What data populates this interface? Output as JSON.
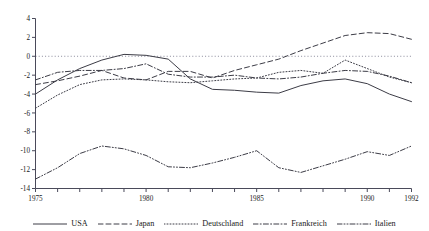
{
  "chart_data": {
    "type": "line",
    "title": "",
    "subtitle": "",
    "xlabel": "",
    "ylabel": "",
    "xlim": [
      1975,
      1992
    ],
    "ylim": [
      -14,
      4
    ],
    "ytick_step": 2,
    "yticks": [
      4,
      2,
      0,
      -2,
      -4,
      -6,
      -8,
      -10,
      -12,
      -14
    ],
    "ytick_labels": [
      "4",
      "2",
      "0",
      "-2",
      "-4",
      "-6",
      "-8",
      "-10",
      "-12",
      "-14"
    ],
    "xticks": [
      1975,
      1976,
      1977,
      1978,
      1979,
      1980,
      1981,
      1982,
      1983,
      1984,
      1985,
      1986,
      1987,
      1988,
      1989,
      1990,
      1991,
      1992
    ],
    "xtick_labels_shown": [
      "1975",
      "1980",
      "1985",
      "1990",
      "1992"
    ],
    "xtick_label_years": [
      1975,
      1980,
      1985,
      1990,
      1992
    ],
    "grid": false,
    "zero_reference_line": true,
    "legend_position": "bottom",
    "x": [
      1975,
      1976,
      1977,
      1978,
      1979,
      1980,
      1981,
      1982,
      1983,
      1984,
      1985,
      1986,
      1987,
      1988,
      1989,
      1990,
      1991,
      1992
    ],
    "series": [
      {
        "name": "USA",
        "style": "solid",
        "values": [
          -4.0,
          -2.5,
          -1.3,
          -0.4,
          0.2,
          0.1,
          -0.3,
          -2.4,
          -3.5,
          -3.6,
          -3.8,
          -3.9,
          -3.1,
          -2.6,
          -2.4,
          -2.9,
          -4.0,
          -4.8
        ]
      },
      {
        "name": "Japan",
        "style": "dashed",
        "values": [
          -3.0,
          -2.6,
          -2.1,
          -1.5,
          -2.3,
          -2.5,
          -1.6,
          -1.6,
          -2.3,
          -1.5,
          -0.9,
          -0.3,
          0.6,
          1.4,
          2.2,
          2.5,
          2.4,
          1.8
        ]
      },
      {
        "name": "Deutschland",
        "style": "dotted",
        "values": [
          -5.5,
          -4.1,
          -3.0,
          -2.5,
          -2.4,
          -2.5,
          -2.7,
          -2.8,
          -2.6,
          -2.4,
          -2.3,
          -1.7,
          -1.5,
          -1.8,
          -0.4,
          -1.3,
          -2.2,
          -2.8
        ]
      },
      {
        "name": "Frankreich",
        "style": "dash-dot",
        "values": [
          -2.5,
          -1.7,
          -1.5,
          -1.5,
          -1.3,
          -0.8,
          -1.9,
          -2.2,
          -2.2,
          -2.0,
          -2.3,
          -2.4,
          -2.2,
          -1.8,
          -1.5,
          -1.6,
          -2.1,
          -2.8
        ]
      },
      {
        "name": "Italien",
        "style": "dash-dot-dot",
        "values": [
          -13.0,
          -11.8,
          -10.3,
          -9.5,
          -9.8,
          -10.5,
          -11.7,
          -11.8,
          -11.3,
          -10.7,
          -10.0,
          -11.8,
          -12.3,
          -11.6,
          -10.9,
          -10.1,
          -10.5,
          -9.5
        ]
      }
    ]
  },
  "legend": {
    "items": [
      {
        "label": "USA",
        "style": "solid"
      },
      {
        "label": "Japan",
        "style": "dashed"
      },
      {
        "label": "Deutschland",
        "style": "dotted"
      },
      {
        "label": "Frankreich",
        "style": "dash-dot"
      },
      {
        "label": "Italien",
        "style": "dash-dot-dot"
      }
    ]
  },
  "colors": {
    "axis": "#4a4a5a",
    "series": "#3c3c46",
    "zero_line": "#8a8a9a",
    "background": "#ffffff"
  }
}
